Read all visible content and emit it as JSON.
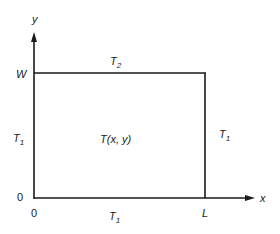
{
  "diagram": {
    "title": "",
    "axes": {
      "x_label": "x",
      "y_label": "y"
    },
    "tick_labels": {
      "origin_y": "0",
      "origin_x": "0",
      "width": "W",
      "length": "L"
    },
    "boundary_conditions": {
      "top": {
        "symbol": "T",
        "subscript": "2"
      },
      "left": {
        "symbol": "T",
        "subscript": "1"
      },
      "right": {
        "symbol": "T",
        "subscript": "1"
      },
      "bottom": {
        "symbol": "T",
        "subscript": "1"
      }
    },
    "interior_label": "T(x, y)",
    "colors": {
      "line": "#1a1a1a",
      "background": "#ffffff"
    }
  }
}
